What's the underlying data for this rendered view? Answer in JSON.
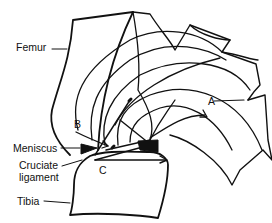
{
  "diagram": {
    "labels": {
      "femur": "Femur",
      "a": "A",
      "b": "B",
      "meniscus": "Meniscus",
      "cruciate_line1": "Cruciate",
      "cruciate_line2": "ligament",
      "c": "C",
      "tibia": "Tibia"
    },
    "colors": {
      "line": "#111111",
      "background": "#ffffff"
    }
  }
}
